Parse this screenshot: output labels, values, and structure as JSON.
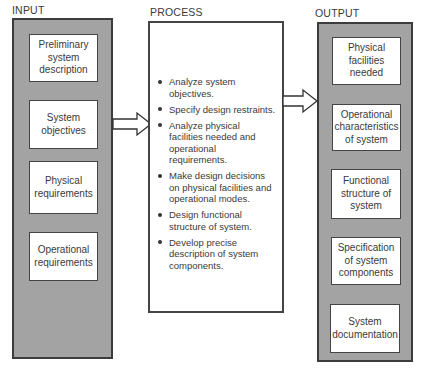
{
  "input": {
    "label": "INPUT",
    "items": [
      {
        "text": "Preliminary system description"
      },
      {
        "text": "System objectives"
      },
      {
        "text": "Physical requirements"
      },
      {
        "text": "Operational requirements"
      }
    ]
  },
  "process": {
    "label": "PROCESS",
    "steps": [
      {
        "text": "Analyze system objectives."
      },
      {
        "text": "Specify design restraints."
      },
      {
        "text": "Analyze physical facilities needed and operational requirements."
      },
      {
        "text": "Make design decisions on physical facilities and operational modes."
      },
      {
        "text": "Design functional structure of system."
      },
      {
        "text": "Develop precise description of system components."
      }
    ]
  },
  "output": {
    "label": "OUTPUT",
    "items": [
      {
        "text": "Physical facilities needed"
      },
      {
        "text": "Operational characteristics of system"
      },
      {
        "text": "Functional structure of system"
      },
      {
        "text": "Specification of system components"
      },
      {
        "text": "System documentation"
      }
    ]
  },
  "arrows": [
    {
      "from": "input",
      "to": "process"
    },
    {
      "from": "process",
      "to": "output"
    }
  ],
  "colors": {
    "panel_fill": "#a3a3a3",
    "panel_border": "#3c3c3c",
    "box_fill": "#ffffff"
  }
}
